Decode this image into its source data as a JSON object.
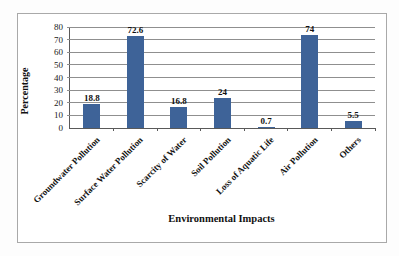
{
  "chart_data": {
    "type": "bar",
    "title": "",
    "categories": [
      "Groundwater Pollution",
      "Surface Water Pollution",
      "Scarcity of Water",
      "Soil Pollution",
      "Loss of Aquatic Life",
      "Air Pollution",
      "Others"
    ],
    "values": [
      18.8,
      72.6,
      16.8,
      24,
      0.7,
      74,
      5.5
    ],
    "value_labels": [
      "18.8",
      "72.6",
      "16.8",
      "24",
      "0.7",
      "74",
      "5.5"
    ],
    "xlabel": "Environmental Impacts",
    "ylabel": "Percentage",
    "ylim": [
      0,
      80
    ],
    "ytick_step": 10,
    "ytick_labels": [
      "0",
      "10",
      "20",
      "30",
      "40",
      "50",
      "60",
      "70",
      "80"
    ],
    "grid": "horizontal",
    "legend_position": "none",
    "bar_color": "#3e6398",
    "gridline_color": "#8f8f8f",
    "axis_color": "#595959",
    "frame_border_color": "#a9a9a9"
  }
}
